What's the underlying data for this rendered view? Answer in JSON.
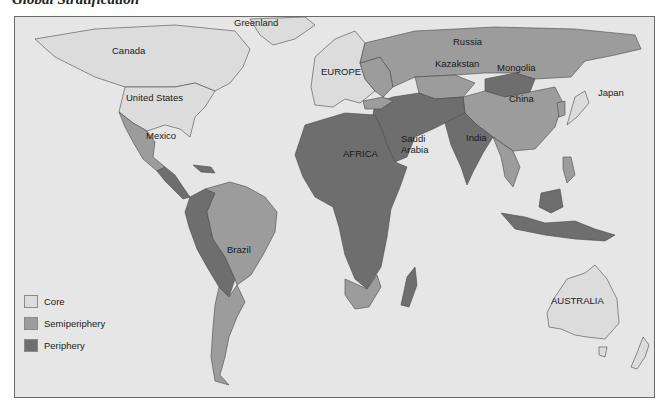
{
  "title": "Global Stratification",
  "colors": {
    "ocean": "#e6e6e6",
    "core": "#dcdcdc",
    "semiperiphery": "#9c9c9c",
    "periphery": "#6e6e6e",
    "border": "#4a4a4a"
  },
  "labels": {
    "greenland": "Greenland",
    "canada": "Canada",
    "united_states": "United States",
    "mexico": "Mexico",
    "brazil": "Brazil",
    "europe": "EUROPE",
    "africa": "AFRICA",
    "saudi_arabia": "Saudi Arabia",
    "india": "India",
    "russia": "Russia",
    "kazakstan": "Kazakstan",
    "mongolia": "Mongolia",
    "china": "China",
    "japan": "Japan",
    "australia": "AUSTRALIA"
  },
  "legend": [
    {
      "label": "Core",
      "category": "core"
    },
    {
      "label": "Semiperiphery",
      "category": "semiperiphery"
    },
    {
      "label": "Periphery",
      "category": "periphery"
    }
  ]
}
